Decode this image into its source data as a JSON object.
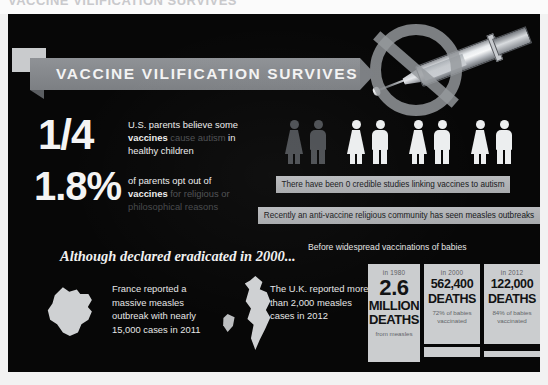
{
  "top_strip": {
    "ghost_text": "VACCINE VILIFICATION SURVIVES"
  },
  "poster": {
    "banner_title": "VACCINE VILIFICATION SURVIVES",
    "graphics": {
      "syringe_icon": "syringe-icon",
      "prohibition_icon": "no-symbol-icon",
      "france_map": "france-map-icon",
      "uk_map": "uk-map-icon",
      "ireland_map": "ireland-map-icon"
    },
    "stats": [
      {
        "figure": "1/4",
        "text_lead": "U.S. parents believe some",
        "text_bold": "vaccines",
        "text_dim": " cause autism",
        "text_tail": " in",
        "text_last": "healthy children"
      },
      {
        "figure": "1.8%",
        "text_lead": "of parents opt out of",
        "text_bold": "vaccines",
        "text_dim": " for religious or",
        "text_last": "philosophical reasons"
      }
    ],
    "people": {
      "total": 8,
      "affected": 2,
      "affected_color": "#4d5054",
      "unaffected_color": "#eceeef"
    },
    "callouts": [
      "There have been 0 credible studies linking vaccines to autism",
      "Recently an anti-vaccine religious community has seen measles outbreaks"
    ],
    "eradicated_headline": "Although declared eradicated in 2000...",
    "country_reports": [
      {
        "text": "France reported a massive measles outbreak with nearly 15,000 cases in 2011"
      },
      {
        "text": "The U.K. reported more than 2,000 measles cases in 2012"
      }
    ],
    "deaths_section": {
      "label": "Before widespread vaccinations of babies",
      "panels": [
        {
          "year": "in 1980",
          "number": "2.6",
          "unit_line_1": "MILLION",
          "unit_line_2": "DEATHS",
          "note": "from measles"
        },
        {
          "year": "in 2000",
          "number": "562,400",
          "unit_line_1": "DEATHS",
          "note": "72% of babies vaccinated"
        },
        {
          "year": "in 2012",
          "number": "122,000",
          "unit_line_1": "DEATHS",
          "note": "84% of babies vaccinated"
        }
      ]
    }
  }
}
